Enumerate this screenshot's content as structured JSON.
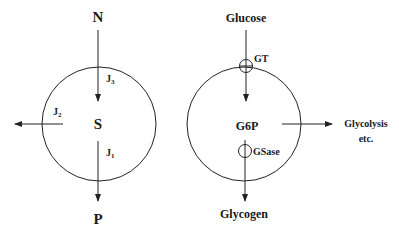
{
  "diagram": {
    "left": {
      "top_label": "N",
      "center_label": "S",
      "bottom_label": "P",
      "fluxes": [
        {
          "name": "J",
          "sub": "3",
          "direction": "N to S"
        },
        {
          "name": "J",
          "sub": "2",
          "direction": "S to outside (left)"
        },
        {
          "name": "J",
          "sub": "1",
          "direction": "S to P"
        }
      ]
    },
    "right": {
      "top_label": "Glucose",
      "center_label": "G6P",
      "bottom_label": "Glycogen",
      "side_label_line1": "Glycolysis",
      "side_label_line2": "etc.",
      "transporter_top": "GT",
      "enzyme_bottom": "GSase"
    },
    "colors": {
      "stroke": "#222222",
      "text": "#1a1a1a",
      "background": "#ffffff"
    }
  }
}
